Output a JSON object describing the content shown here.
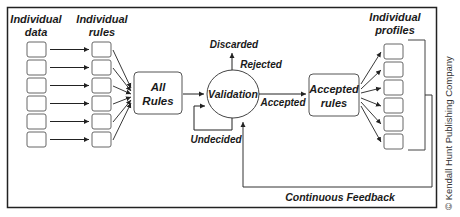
{
  "diagram": {
    "columns": {
      "data_label_1": "Individual",
      "data_label_2": "data",
      "rules_label_1": "Individual",
      "rules_label_2": "rules",
      "profiles_label_1": "Individual",
      "profiles_label_2": "profiles"
    },
    "nodes": {
      "all_rules_1": "All",
      "all_rules_2": "Rules",
      "validation": "Validation",
      "accepted_rules_1": "Accepted",
      "accepted_rules_2": "rules"
    },
    "edges": {
      "discarded": "Discarded",
      "rejected": "Rejected",
      "accepted": "Accepted",
      "undecided": "Undecided",
      "feedback": "Continuous Feedback"
    },
    "counts": {
      "data_boxes": 6,
      "rule_boxes": 6,
      "profile_boxes": 6
    },
    "copyright": "© Kendall Hunt Publishing Company"
  }
}
